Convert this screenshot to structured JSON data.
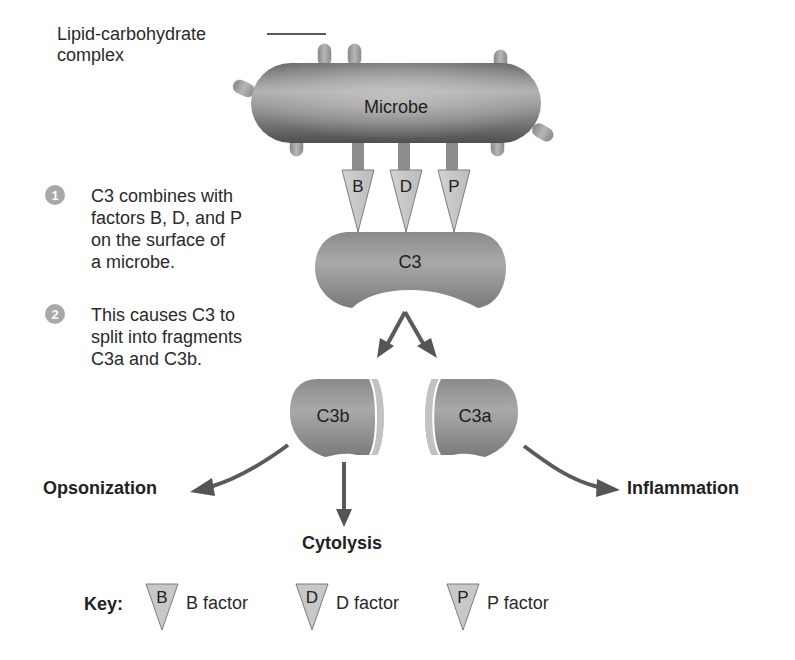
{
  "diagram": {
    "labels": {
      "lipid_line1": "Lipid-carbohydrate",
      "lipid_line2": "complex",
      "microbe": "Microbe",
      "c3": "C3",
      "c3b": "C3b",
      "c3a": "C3a"
    },
    "factors": [
      {
        "letter": "B"
      },
      {
        "letter": "D"
      },
      {
        "letter": "P"
      }
    ],
    "steps": [
      {
        "number": "1",
        "lines": [
          "C3 combines with",
          "factors B, D, and P",
          "on the surface of",
          "a microbe."
        ]
      },
      {
        "number": "2",
        "lines": [
          "This causes C3 to",
          "split into fragments",
          "C3a and C3b."
        ]
      }
    ],
    "outcomes": {
      "opsonization": "Opsonization",
      "cytolysis": "Cytolysis",
      "inflammation": "Inflammation"
    },
    "key": {
      "title": "Key:",
      "items": [
        {
          "letter": "B",
          "label": "B factor"
        },
        {
          "letter": "D",
          "label": "D factor"
        },
        {
          "letter": "P",
          "label": "P factor"
        }
      ]
    },
    "colors": {
      "shape_dark": "#6f6f6f",
      "shape_mid": "#9a9a9a",
      "shape_light": "#bdbdbd",
      "triangle_fill": "#c8c8c8",
      "arrow": "#555555",
      "step_circle": "#a8a8a8"
    }
  }
}
